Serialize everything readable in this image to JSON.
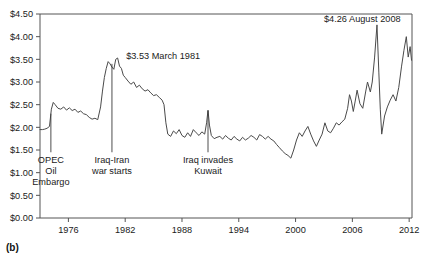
{
  "figure": {
    "panel_label": "(b)"
  },
  "chart_data": {
    "type": "line",
    "title": "",
    "subtitle": "",
    "xlabel": "",
    "ylabel": "",
    "xlim": [
      1973.0,
      2012.3
    ],
    "ylim": [
      0.0,
      4.5
    ],
    "grid": false,
    "legend_position": "none",
    "x_ticks": [
      1976,
      1982,
      1988,
      1994,
      2000,
      2006,
      2012
    ],
    "x_tick_labels": [
      "1976",
      "1982",
      "1988",
      "1994",
      "2000",
      "2006",
      "2012"
    ],
    "y_ticks": [
      0.0,
      0.5,
      1.0,
      1.5,
      2.0,
      2.5,
      3.0,
      3.5,
      4.0,
      4.5
    ],
    "y_tick_labels": [
      "$0.00",
      "$0.50",
      "$1.00",
      "$1.50",
      "$2.00",
      "$2.50",
      "$3.00",
      "$3.50",
      "$4.00",
      "$4.50"
    ],
    "series": [
      {
        "name": "Gasoline price",
        "color": "#4a4a4a",
        "x": [
          1973.0,
          1973.25,
          1973.5,
          1973.75,
          1974.0,
          1974.2,
          1974.4,
          1974.6,
          1974.9,
          1975.2,
          1975.5,
          1975.8,
          1976.1,
          1976.4,
          1976.7,
          1977.0,
          1977.3,
          1977.6,
          1977.9,
          1978.2,
          1978.5,
          1978.8,
          1979.1,
          1979.4,
          1979.6,
          1979.8,
          1980.0,
          1980.2,
          1980.4,
          1980.6,
          1980.8,
          1981.0,
          1981.2,
          1981.4,
          1981.6,
          1981.8,
          1982.0,
          1982.3,
          1982.6,
          1982.9,
          1983.2,
          1983.5,
          1983.8,
          1984.1,
          1984.4,
          1984.7,
          1985.0,
          1985.3,
          1985.6,
          1985.9,
          1986.1,
          1986.3,
          1986.5,
          1986.8,
          1987.1,
          1987.4,
          1987.7,
          1988.0,
          1988.3,
          1988.6,
          1988.9,
          1989.2,
          1989.5,
          1989.8,
          1990.1,
          1990.4,
          1990.6,
          1990.75,
          1990.9,
          1991.1,
          1991.4,
          1991.7,
          1992.0,
          1992.3,
          1992.6,
          1992.9,
          1993.2,
          1993.5,
          1993.8,
          1994.1,
          1994.4,
          1994.7,
          1995.0,
          1995.3,
          1995.6,
          1995.9,
          1996.2,
          1996.5,
          1996.8,
          1997.1,
          1997.4,
          1997.7,
          1998.0,
          1998.3,
          1998.6,
          1998.9,
          1999.2,
          1999.5,
          1999.8,
          2000.1,
          2000.4,
          2000.7,
          2001.0,
          2001.3,
          2001.6,
          2001.9,
          2002.2,
          2002.5,
          2002.8,
          2003.1,
          2003.4,
          2003.7,
          2004.0,
          2004.3,
          2004.6,
          2004.9,
          2005.2,
          2005.5,
          2005.7,
          2005.9,
          2006.1,
          2006.3,
          2006.5,
          2006.8,
          2007.1,
          2007.4,
          2007.6,
          2007.9,
          2008.1,
          2008.35,
          2008.6,
          2008.8,
          2008.95,
          2009.1,
          2009.4,
          2009.7,
          2010.0,
          2010.3,
          2010.6,
          2010.9,
          2011.2,
          2011.45,
          2011.7,
          2011.9,
          2012.1,
          2012.25
        ],
        "y": [
          1.95,
          1.95,
          1.96,
          1.98,
          2.02,
          2.4,
          2.55,
          2.5,
          2.42,
          2.4,
          2.45,
          2.38,
          2.43,
          2.37,
          2.4,
          2.33,
          2.36,
          2.3,
          2.28,
          2.22,
          2.18,
          2.2,
          2.17,
          2.45,
          2.8,
          3.1,
          3.3,
          3.45,
          3.4,
          3.33,
          3.28,
          3.5,
          3.53,
          3.35,
          3.3,
          3.15,
          3.1,
          3.02,
          2.95,
          3.0,
          2.88,
          2.93,
          2.85,
          2.8,
          2.83,
          2.76,
          2.7,
          2.72,
          2.66,
          2.6,
          2.5,
          2.1,
          1.85,
          1.8,
          1.92,
          1.86,
          1.95,
          1.82,
          1.78,
          1.88,
          1.8,
          1.95,
          1.88,
          1.82,
          1.9,
          1.85,
          2.1,
          2.38,
          2.05,
          1.82,
          1.75,
          1.78,
          1.8,
          1.74,
          1.82,
          1.76,
          1.72,
          1.8,
          1.74,
          1.7,
          1.78,
          1.72,
          1.76,
          1.82,
          1.78,
          1.72,
          1.84,
          1.8,
          1.74,
          1.8,
          1.74,
          1.7,
          1.62,
          1.55,
          1.48,
          1.42,
          1.38,
          1.32,
          1.5,
          1.72,
          1.88,
          1.8,
          1.92,
          2.02,
          1.85,
          1.7,
          1.58,
          1.72,
          1.85,
          2.1,
          1.92,
          1.88,
          1.98,
          2.1,
          2.05,
          2.12,
          2.18,
          2.42,
          2.72,
          2.58,
          2.35,
          2.58,
          2.82,
          2.52,
          2.42,
          2.78,
          3.0,
          2.78,
          3.0,
          3.55,
          4.26,
          3.2,
          2.4,
          1.85,
          2.25,
          2.45,
          2.6,
          2.72,
          2.58,
          2.88,
          3.35,
          3.7,
          4.0,
          3.55,
          3.78,
          3.48
        ]
      }
    ],
    "annotations": [
      {
        "id": "opec-oil-embargo",
        "lines": [
          "OPEC",
          "Oil",
          "Embargo"
        ],
        "text": "OPEC Oil Embargo",
        "x": 1974.15,
        "leader_top": 2.3,
        "leader_bottom": 1.45
      },
      {
        "id": "iraq-iran-war-starts",
        "lines": [
          "Iraq-Iran",
          "war starts"
        ],
        "text": "Iraq-Iran war starts",
        "x": 1980.6,
        "leader_top": 3.4,
        "leader_bottom": 1.45
      },
      {
        "id": "iraq-invades-kuwait",
        "lines": [
          "Iraq invades",
          "Kuwait"
        ],
        "text": "Iraq invades Kuwait",
        "x": 1990.75,
        "leader_top": 2.36,
        "leader_bottom": 1.45
      },
      {
        "id": "peak-1981",
        "text": "$3.53 March 1981",
        "x": 1982.1,
        "y": 3.5
      },
      {
        "id": "peak-2008",
        "text": "$4.26 August 2008",
        "x": 2003.0,
        "y": 4.33
      }
    ]
  }
}
